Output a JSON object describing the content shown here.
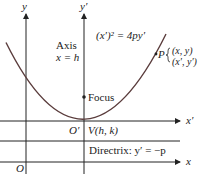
{
  "diagram": {
    "labels": {
      "y_axis": "y",
      "y_prime_axis": "y′",
      "x_axis": "x",
      "x_prime_axis": "x′",
      "origin": "O",
      "origin_prime": "O′",
      "axis_line1": "Axis",
      "axis_line2": "x = h",
      "equation": "(x′)² = 4py′",
      "focus": "Focus",
      "vertex": "V(h, k)",
      "point_p": "P",
      "p_coord1": "(x, y)",
      "p_coord2": "(x′, y′)",
      "directrix": "Directrix: y′ = −p"
    },
    "colors": {
      "curve": "#5a3c3c",
      "axes": "#222222"
    }
  }
}
